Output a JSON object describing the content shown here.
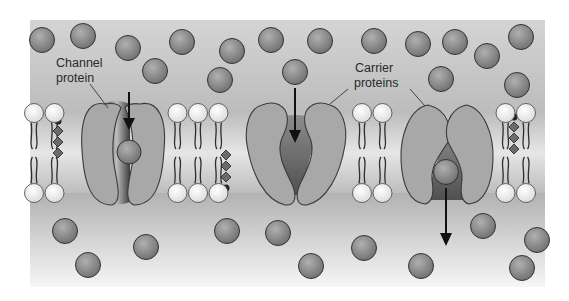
{
  "figure": {
    "bounds": {
      "x": 30,
      "y": 20,
      "w": 515,
      "h": 267
    },
    "colors": {
      "extracellular_top": "#cfcfcf",
      "extracellular_bottom": "#bdbdbd",
      "intracellular_top": "#b5b5b5",
      "intracellular_bottom": "#f4f4f4",
      "membrane_core": "#c8c8c8",
      "head": "#f4f4f4",
      "protein": "#a9a9a9",
      "solute": "#8a8a8a",
      "outline": "#3a3a3a"
    }
  },
  "labels": {
    "channel": [
      "Channel",
      "protein"
    ],
    "carrier": [
      "Carrier",
      "proteins"
    ]
  },
  "membrane": {
    "top_head_y": 113,
    "bottom_head_y": 193,
    "head_r": 9.5
  },
  "solutes": [
    [
      42,
      40
    ],
    [
      83,
      36
    ],
    [
      128,
      48
    ],
    [
      155,
      71
    ],
    [
      182,
      42
    ],
    [
      232,
      51
    ],
    [
      271,
      40
    ],
    [
      320,
      41
    ],
    [
      374,
      41
    ],
    [
      418,
      44
    ],
    [
      455,
      42
    ],
    [
      487,
      56
    ],
    [
      521,
      37
    ],
    [
      220,
      80
    ],
    [
      295,
      72
    ],
    [
      441,
      79
    ],
    [
      517,
      85
    ],
    [
      129,
      152
    ],
    [
      446,
      172
    ],
    [
      65,
      231
    ],
    [
      88,
      265
    ],
    [
      146,
      247
    ],
    [
      227,
      231
    ],
    [
      278,
      233
    ],
    [
      311,
      266
    ],
    [
      364,
      248
    ],
    [
      421,
      266
    ],
    [
      483,
      226
    ],
    [
      522,
      268
    ],
    [
      537,
      240
    ]
  ]
}
